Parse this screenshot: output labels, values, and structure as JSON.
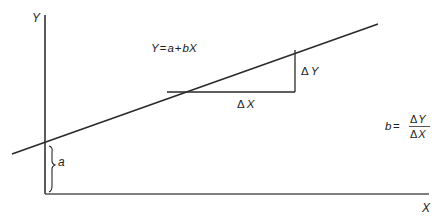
{
  "diagram": {
    "type": "linear-regression-line",
    "axes": {
      "y_label": "Y",
      "x_label": "X"
    },
    "equation": "Y = a + bX",
    "equation_parts": {
      "lhs": "Y",
      "eq": "=",
      "a": "a",
      "plus": "+",
      "bx": "bX"
    },
    "intercept_label": "a",
    "delta_x_label": "X",
    "delta_y_label": "Y",
    "delta_symbol": "Δ",
    "slope_formula": {
      "lhs": "b",
      "eq": "=",
      "numerator": "Y",
      "denominator": "X"
    },
    "colors": {
      "line": "#2a2a2a",
      "axis": "#333333",
      "text": "#222222",
      "background": "#ffffff"
    }
  }
}
